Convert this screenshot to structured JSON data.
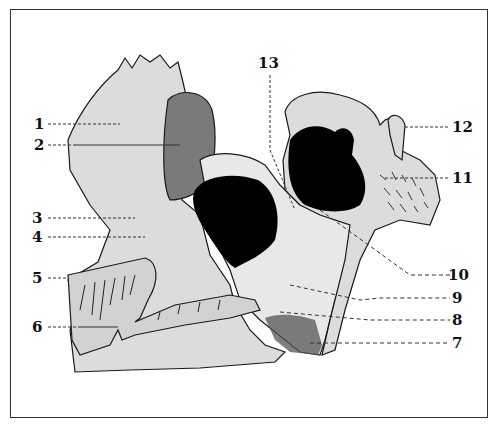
{
  "diagram": {
    "type": "anatomical-line-drawing",
    "colors": {
      "bone_fill": "#dcdcdc",
      "dark_region": "#7a7a7a",
      "cavity": "#000000",
      "outline": "#1a1a1a",
      "background": "#ffffff"
    },
    "labels": [
      {
        "id": "1",
        "text": "1",
        "side": "left"
      },
      {
        "id": "2",
        "text": "2",
        "side": "left"
      },
      {
        "id": "3",
        "text": "3",
        "side": "left"
      },
      {
        "id": "4",
        "text": "4",
        "side": "left"
      },
      {
        "id": "5",
        "text": "5",
        "side": "left"
      },
      {
        "id": "6",
        "text": "6",
        "side": "left"
      },
      {
        "id": "7",
        "text": "7",
        "side": "right"
      },
      {
        "id": "8",
        "text": "8",
        "side": "right"
      },
      {
        "id": "9",
        "text": "9",
        "side": "right"
      },
      {
        "id": "10",
        "text": "10",
        "side": "right"
      },
      {
        "id": "11",
        "text": "11",
        "side": "right"
      },
      {
        "id": "12",
        "text": "12",
        "side": "right"
      },
      {
        "id": "13",
        "text": "13",
        "side": "top"
      }
    ]
  }
}
